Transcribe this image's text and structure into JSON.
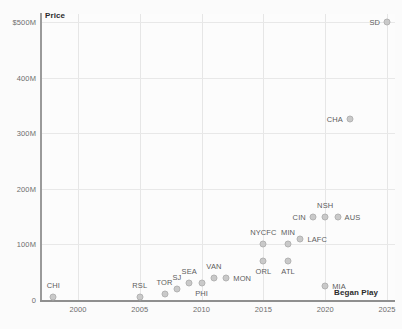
{
  "chart": {
    "price_axis_title": "Price",
    "began_play_axis_title": "Began Play"
  },
  "chart_data": {
    "type": "scatter",
    "title": "",
    "subtitle": "",
    "xlabel": "Began Play",
    "ylabel": "Price",
    "xlim": [
      1997,
      2026
    ],
    "ylim": [
      0,
      500
    ],
    "grid": true,
    "legend": false,
    "x_ticks": [
      "2000",
      "2005",
      "2010",
      "2015",
      "2020",
      "2025"
    ],
    "x_tick_values": [
      2000,
      2005,
      2010,
      2015,
      2020,
      2025
    ],
    "y_ticks": [
      "0",
      "100M",
      "200M",
      "300M",
      "400M",
      "$500M"
    ],
    "y_tick_values": [
      0,
      100,
      200,
      300,
      400,
      500
    ],
    "y_units": "millions of US dollars",
    "points": [
      {
        "label": "CHI",
        "x": 1998,
        "y": 5,
        "label_pos": "above"
      },
      {
        "label": "RSL",
        "x": 2005,
        "y": 5,
        "label_pos": "above"
      },
      {
        "label": "TOR",
        "x": 2007,
        "y": 10,
        "label_pos": "above"
      },
      {
        "label": "SJ",
        "x": 2008,
        "y": 20,
        "label_pos": "above"
      },
      {
        "label": "SEA",
        "x": 2009,
        "y": 30,
        "label_pos": "above"
      },
      {
        "label": "PHI",
        "x": 2010,
        "y": 30,
        "label_pos": "below"
      },
      {
        "label": "VAN",
        "x": 2011,
        "y": 40,
        "label_pos": "above"
      },
      {
        "label": "MON",
        "x": 2012,
        "y": 40,
        "label_pos": "right"
      },
      {
        "label": "ORL",
        "x": 2015,
        "y": 70,
        "label_pos": "below"
      },
      {
        "label": "NYCFC",
        "x": 2015,
        "y": 100,
        "label_pos": "above"
      },
      {
        "label": "ATL",
        "x": 2017,
        "y": 70,
        "label_pos": "below"
      },
      {
        "label": "MIN",
        "x": 2017,
        "y": 100,
        "label_pos": "above"
      },
      {
        "label": "LAFC",
        "x": 2018,
        "y": 110,
        "label_pos": "right"
      },
      {
        "label": "CIN",
        "x": 2019,
        "y": 150,
        "label_pos": "left"
      },
      {
        "label": "NSH",
        "x": 2020,
        "y": 150,
        "label_pos": "above"
      },
      {
        "label": "MIA",
        "x": 2020,
        "y": 25,
        "label_pos": "right"
      },
      {
        "label": "AUS",
        "x": 2021,
        "y": 150,
        "label_pos": "right"
      },
      {
        "label": "CHA",
        "x": 2022,
        "y": 325,
        "label_pos": "left"
      },
      {
        "label": "SD",
        "x": 2025,
        "y": 500,
        "label_pos": "left"
      }
    ]
  }
}
